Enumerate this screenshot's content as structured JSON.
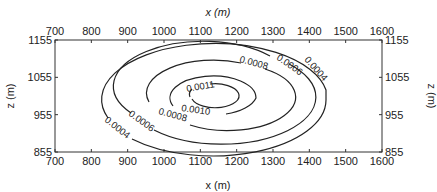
{
  "chart_data": {
    "type": "contour",
    "title": "",
    "xlabel": "x (m)",
    "ylabel": "z (m)",
    "x_ticks": [
      "700",
      "800",
      "900",
      "1000",
      "1100",
      "1200",
      "1300",
      "1400",
      "1500",
      "1600"
    ],
    "y_ticks": [
      "1155",
      "1055",
      "955",
      "855"
    ],
    "xlim": [
      700,
      1600
    ],
    "ylim": [
      855,
      1155
    ],
    "grid": false,
    "center": {
      "x": 1140,
      "z": 1010
    },
    "contours": [
      {
        "level": "0.0004",
        "x_range": [
          825,
          1445
        ],
        "z_range": [
          860,
          1160
        ]
      },
      {
        "level": "0.0006",
        "x_range": [
          890,
          1375
        ],
        "z_range": [
          890,
          1130
        ]
      },
      {
        "level": "0.0008",
        "x_range": [
          955,
          1340
        ],
        "z_range": [
          920,
          1100
        ]
      },
      {
        "level": "0.0010",
        "x_range": [
          1020,
          1250
        ],
        "z_range": [
          950,
          1070
        ]
      },
      {
        "level": "0.0011",
        "x_range": [
          1075,
          1200
        ],
        "z_range": [
          975,
          1040
        ]
      }
    ]
  }
}
